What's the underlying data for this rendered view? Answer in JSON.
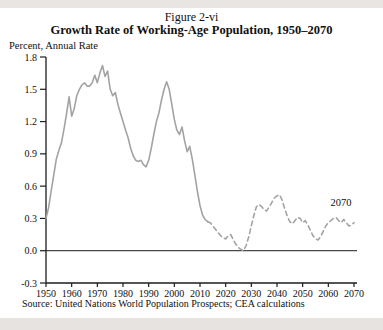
{
  "page": {
    "figure_label": "Figure 2-vi",
    "title": "Growth Rate of Working-Age Population, 1950–2070",
    "axis_unit_label": "Percent, Annual Rate",
    "source": "Source: United Nations World Population Prospects; CEA calculations"
  },
  "colors": {
    "line": "#a3a3a3",
    "axis": "#1c1c1c",
    "zero_line": "#1c1c1c",
    "text": "#101010",
    "outer_band": "#e9e5e2",
    "page_bg": "#ffffff"
  },
  "chart_data": {
    "type": "line",
    "title": "Growth Rate of Working-Age Population, 1950–2070",
    "subtitle": "Figure 2-vi",
    "ylabel": "Percent, Annual Rate",
    "xlabel": "",
    "xlim": [
      1950,
      2070
    ],
    "ylim": [
      -0.3,
      1.8
    ],
    "grid": false,
    "legend": "none",
    "zero_line": true,
    "x_ticks": [
      1950,
      1960,
      1970,
      1980,
      1990,
      2000,
      2010,
      2020,
      2030,
      2040,
      2050,
      2060,
      2070
    ],
    "y_tick_labels": [
      "-0.3",
      "0.0",
      "0.3",
      "0.6",
      "0.9",
      "1.2",
      "1.5",
      "1.8"
    ],
    "annotations": [
      {
        "text": "2070",
        "x": 2069,
        "y": 0.45,
        "anchor": "end"
      }
    ],
    "series": [
      {
        "name": "historical",
        "style": "solid",
        "x": [
          1950,
          1951,
          1952,
          1953,
          1954,
          1955,
          1956,
          1957,
          1958,
          1959,
          1960,
          1961,
          1962,
          1963,
          1964,
          1965,
          1966,
          1967,
          1968,
          1969,
          1970,
          1971,
          1972,
          1973,
          1974,
          1975,
          1976,
          1977,
          1978,
          1979,
          1980,
          1981,
          1982,
          1983,
          1984,
          1985,
          1986,
          1987,
          1988,
          1989,
          1990,
          1991,
          1992,
          1993,
          1994,
          1995,
          1996,
          1997,
          1998,
          1999,
          2000,
          2001,
          2002,
          2003,
          2004,
          2005,
          2006,
          2007,
          2008,
          2009,
          2010,
          2011,
          2012,
          2013
        ],
        "y": [
          0.3,
          0.4,
          0.55,
          0.7,
          0.85,
          0.93,
          1.0,
          1.13,
          1.27,
          1.43,
          1.25,
          1.32,
          1.44,
          1.5,
          1.54,
          1.56,
          1.53,
          1.53,
          1.56,
          1.63,
          1.56,
          1.65,
          1.72,
          1.62,
          1.67,
          1.5,
          1.44,
          1.47,
          1.36,
          1.28,
          1.2,
          1.12,
          1.05,
          0.95,
          0.88,
          0.84,
          0.83,
          0.84,
          0.8,
          0.78,
          0.84,
          0.95,
          1.08,
          1.2,
          1.28,
          1.4,
          1.5,
          1.57,
          1.5,
          1.36,
          1.22,
          1.12,
          1.08,
          1.15,
          1.02,
          0.92,
          0.97,
          0.85,
          0.7,
          0.55,
          0.42,
          0.33,
          0.29,
          0.27
        ]
      },
      {
        "name": "projection",
        "style": "dashed",
        "x": [
          2013,
          2014,
          2015,
          2016,
          2017,
          2018,
          2019,
          2020,
          2021,
          2022,
          2023,
          2024,
          2025,
          2026,
          2027,
          2028,
          2029,
          2030,
          2031,
          2032,
          2033,
          2034,
          2035,
          2036,
          2037,
          2038,
          2039,
          2040,
          2041,
          2042,
          2043,
          2044,
          2045,
          2046,
          2047,
          2048,
          2049,
          2050,
          2051,
          2052,
          2053,
          2054,
          2055,
          2056,
          2057,
          2058,
          2059,
          2060,
          2061,
          2062,
          2063,
          2064,
          2065,
          2066,
          2067,
          2068,
          2069,
          2070
        ],
        "y": [
          0.27,
          0.26,
          0.23,
          0.2,
          0.17,
          0.14,
          0.12,
          0.11,
          0.14,
          0.15,
          0.1,
          0.06,
          0.03,
          0.01,
          0.0,
          0.05,
          0.13,
          0.23,
          0.33,
          0.41,
          0.43,
          0.41,
          0.38,
          0.37,
          0.41,
          0.45,
          0.49,
          0.51,
          0.52,
          0.47,
          0.39,
          0.32,
          0.27,
          0.25,
          0.28,
          0.31,
          0.3,
          0.26,
          0.28,
          0.24,
          0.19,
          0.14,
          0.11,
          0.1,
          0.13,
          0.18,
          0.23,
          0.26,
          0.28,
          0.3,
          0.31,
          0.28,
          0.26,
          0.29,
          0.26,
          0.23,
          0.24,
          0.26
        ]
      }
    ]
  }
}
